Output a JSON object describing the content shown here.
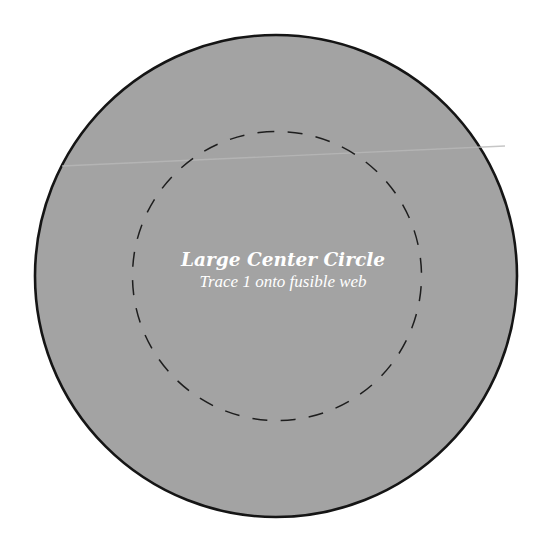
{
  "pattern": {
    "title": "Large Center Circle",
    "instruction": "Trace 1 onto fusible web"
  },
  "colors": {
    "background": "#ffffff",
    "fill": "#a3a3a3",
    "outline": "#151515",
    "dash": "#1e1e1e",
    "text": "#ffffff",
    "streak": "#b8b8b8"
  }
}
